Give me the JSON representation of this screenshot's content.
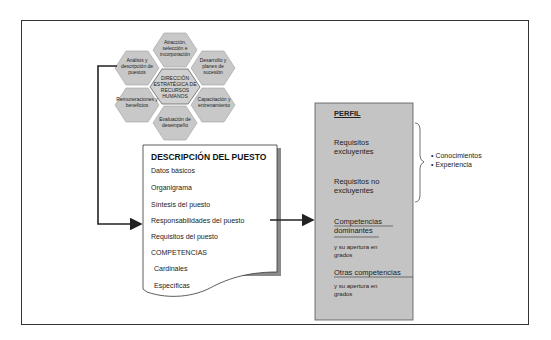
{
  "hexagons": {
    "center": "DIRECCIÓN ESTRATÉGICA DE RECURSOS HUMANOS",
    "top": "Atracción, selección e incorporación",
    "upper_left": "Análisis y descripción de puestos",
    "upper_right": "Desarrollo y planes de sucesión",
    "lower_left": "Remuneraciones y beneficios",
    "lower_right": "Capacitación y entrenamiento",
    "bottom": "Evaluación de desempeño"
  },
  "document": {
    "title": "DESCRIPCIÓN DEL PUESTO",
    "items": [
      "Datos básicos",
      "Organigrama",
      "Síntesis del puesto",
      "Responsabilidades del puesto",
      "Requisitos del puesto",
      "COMPETENCIAS",
      "Cardinales",
      "Específicas"
    ]
  },
  "perfil": {
    "title": "PERFIL",
    "req_excl": "Requisitos excluyentes",
    "req_no_excl": "Requisitos no excluyentes",
    "comp_dom": "Competencias dominantes",
    "apertura_1": "y su apertura en grados",
    "otras": "Otras competencias",
    "apertura_2": "y su apertura en grados"
  },
  "brace_items": [
    "Conocimientos",
    "Experiencia"
  ],
  "colors": {
    "hex_fill": "#c8c8c8",
    "perfil_fill": "#c4c4c4",
    "shadow": "#8a8a8a",
    "line": "#222222"
  }
}
